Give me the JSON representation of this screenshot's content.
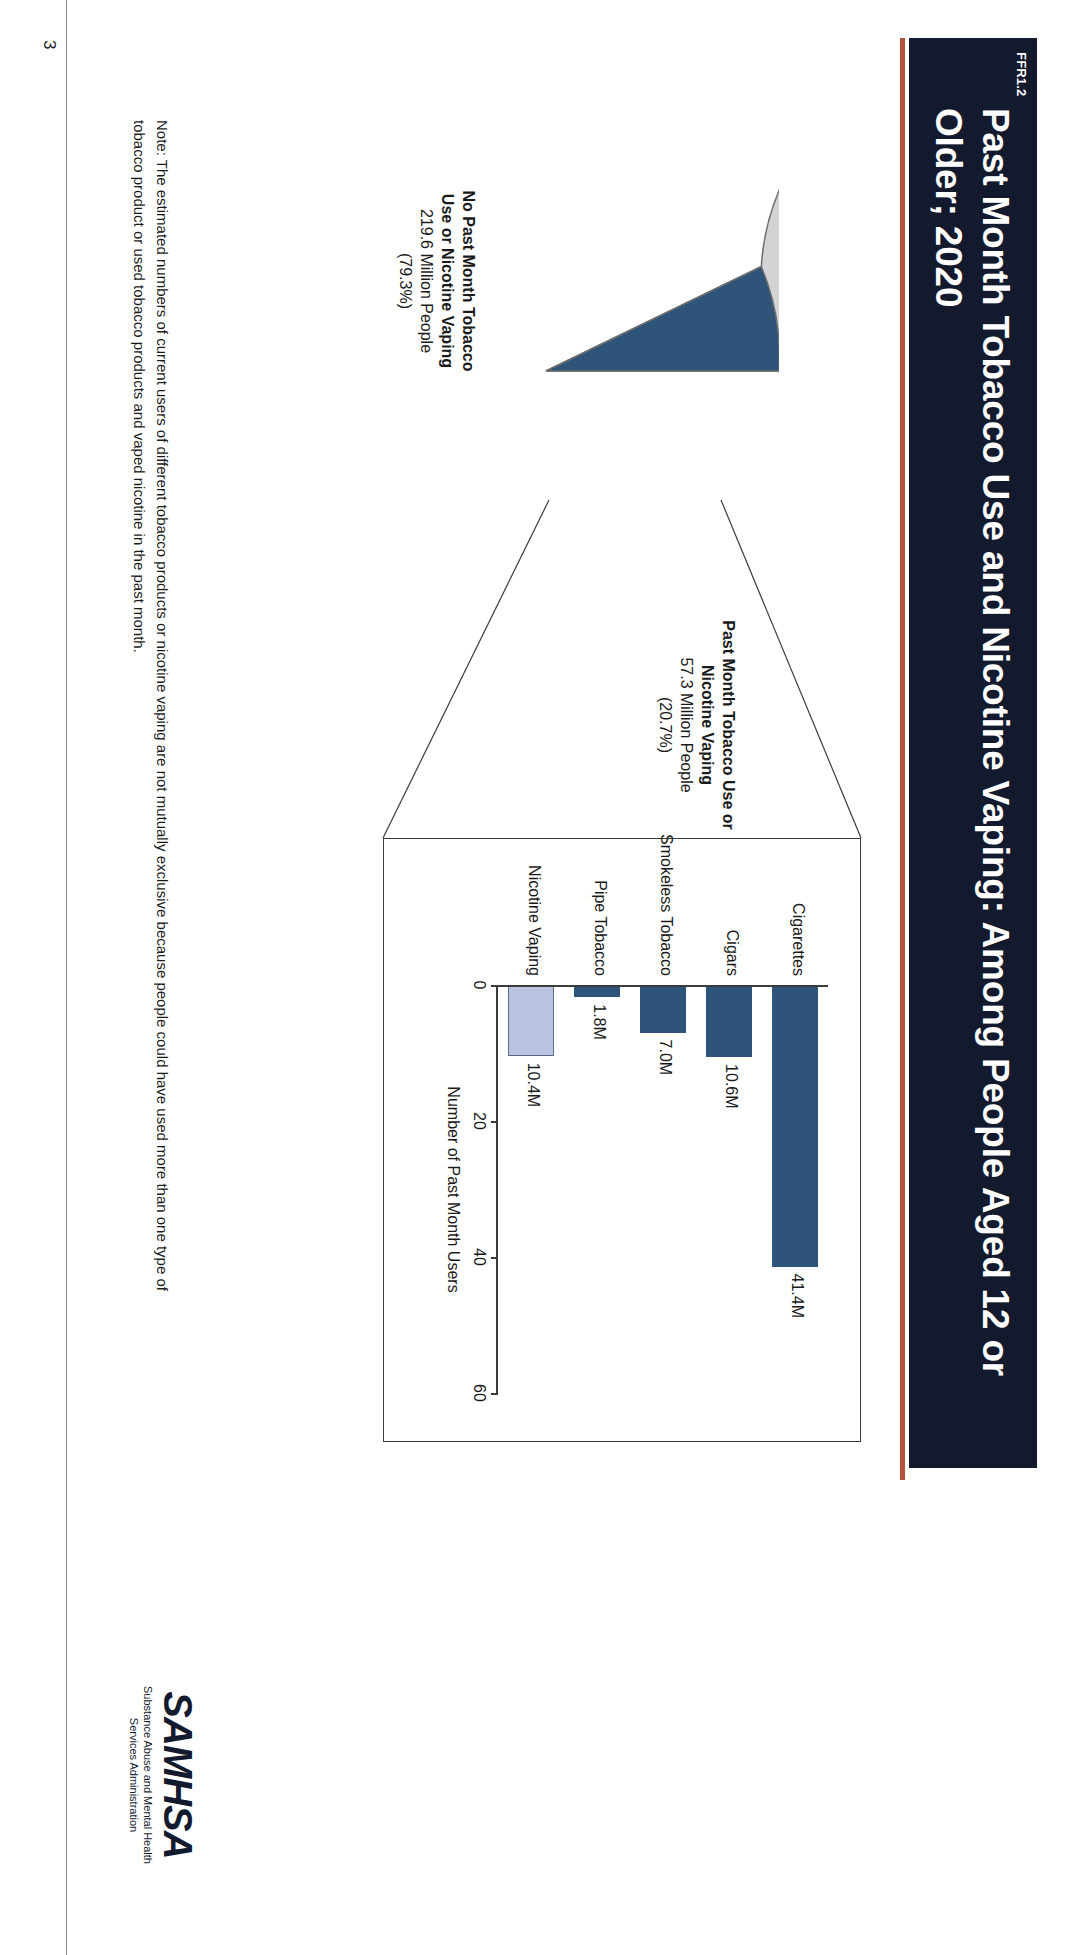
{
  "banner": {
    "tag": "FFR1.2",
    "title": "Past Month Tobacco Use and Nicotine Vaping: Among People Aged 12 or Older; 2020",
    "bg_color": "#141a2e",
    "rule_color": "#b4523c"
  },
  "chart_data": [
    {
      "type": "pie",
      "title": "Past Month Tobacco Use and Nicotine Vaping",
      "slices": [
        {
          "label": "No Past Month Tobacco Use or Nicotine Vaping",
          "value_text": "219.6 Million People",
          "percent_text": "(79.3%)",
          "percent": 79.3,
          "value": 219.6,
          "color": "#d2d3d5"
        },
        {
          "label": "Past Month Tobacco Use or Nicotine Vaping",
          "value_text": "57.3 Million People",
          "percent_text": "(20.7%)",
          "percent": 20.7,
          "value": 57.3,
          "color": "#2e5579"
        }
      ],
      "legend_position": "callout-labels"
    },
    {
      "type": "bar",
      "orientation": "horizontal",
      "categories": [
        "Cigarettes",
        "Cigars",
        "Smokeless Tobacco",
        "Pipe Tobacco",
        "Nicotine Vaping"
      ],
      "values": [
        41.4,
        10.6,
        7.0,
        1.8,
        10.4
      ],
      "value_labels": [
        "41.4M",
        "10.6M",
        "7.0M",
        "1.8M",
        "10.4M"
      ],
      "colors": [
        "#2e5579",
        "#2e5579",
        "#2e5579",
        "#2e5579",
        "#b8c4e0"
      ],
      "title": "",
      "xlabel": "Number of Past Month Users",
      "ylabel": "",
      "xlim": [
        0,
        60
      ],
      "xticks": [
        0,
        20,
        40,
        60
      ],
      "xtick_labels": [
        "0",
        "20",
        "40",
        "60"
      ],
      "grid": false
    }
  ],
  "note": {
    "text": "Note: The estimated numbers of current users of different tobacco products or nicotine vaping are not mutually exclusive because people could have used more than one type of tobacco product or used tobacco products and vaped nicotine in the past month."
  },
  "logo": {
    "mark": "SAMHSA",
    "line1": "Substance Abuse and Mental Health",
    "line2": "Services Administration"
  },
  "page": {
    "number": "3"
  }
}
